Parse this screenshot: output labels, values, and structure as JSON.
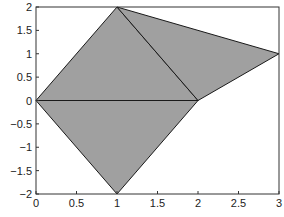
{
  "chart_data": {
    "type": "area",
    "title": "",
    "xlabel": "",
    "ylabel": "",
    "xlim": [
      0,
      3
    ],
    "ylim": [
      -2,
      2
    ],
    "grid": false,
    "legend": null,
    "x_ticks": [
      0,
      0.5,
      1,
      1.5,
      2,
      2.5,
      3
    ],
    "x_tick_labels": [
      "0",
      "0.5",
      "1",
      "1.5",
      "2",
      "2.5",
      "3"
    ],
    "y_ticks": [
      -2,
      -1.5,
      -1,
      -0.5,
      0,
      0.5,
      1,
      1.5,
      2
    ],
    "y_tick_labels": [
      "−2",
      "−1.5",
      "−1",
      "−0.5",
      "0",
      "0.5",
      "1",
      "1.5",
      "2"
    ],
    "fill_color": "#a0a0a0",
    "edge_color": "#1a1a1a",
    "polygons": [
      {
        "name": "upper-left-triangle",
        "vertices": [
          [
            0,
            0
          ],
          [
            1,
            2
          ],
          [
            2,
            0
          ]
        ]
      },
      {
        "name": "upper-right-triangle",
        "vertices": [
          [
            1,
            2
          ],
          [
            3,
            1
          ],
          [
            2,
            0
          ]
        ]
      },
      {
        "name": "lower-triangle",
        "vertices": [
          [
            0,
            0
          ],
          [
            2,
            0
          ],
          [
            1,
            -2
          ]
        ]
      }
    ]
  }
}
